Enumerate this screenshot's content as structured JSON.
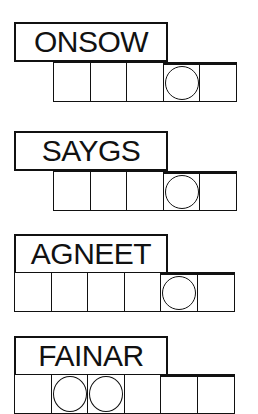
{
  "puzzles": [
    {
      "scrambled": "ONSOW",
      "slots": 5,
      "circled": [
        4
      ]
    },
    {
      "scrambled": "SAYGS",
      "slots": 5,
      "circled": [
        4
      ]
    },
    {
      "scrambled": "AGNEET",
      "slots": 6,
      "circled": [
        5
      ]
    },
    {
      "scrambled": "FAINAR",
      "slots": 6,
      "circled": [
        2,
        3
      ]
    }
  ]
}
